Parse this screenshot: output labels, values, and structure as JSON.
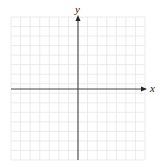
{
  "diagram": {
    "type": "coordinate-plane",
    "x_axis_label": "x",
    "y_axis_label": "y",
    "grid": {
      "columns": 14,
      "rows": 15,
      "left": 11,
      "top": 17,
      "right": 145,
      "bottom": 160,
      "line_color": "#e6e6e6"
    },
    "origin": {
      "x": 78,
      "y": 89
    },
    "axis_color": "#444444",
    "background": "#ffffff"
  }
}
